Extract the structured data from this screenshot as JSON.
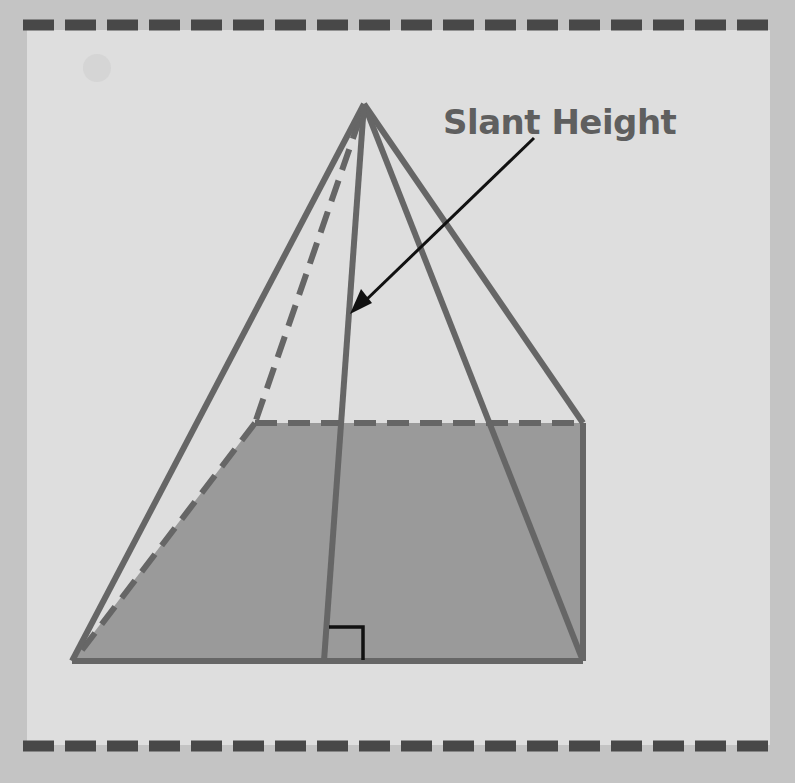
{
  "diagram": {
    "label": "Slant Height",
    "annotations": {
      "right_angle_marker": "right angle at base midpoint",
      "arrow": "points to slant height line"
    },
    "colors": {
      "background_outer": "#c4c4c4",
      "panel": "#dedede",
      "edge": "#666666",
      "base_fill": "#9a9a9a",
      "dash_border": "#484848",
      "arrow": "#111111",
      "label": "#5f5f5f"
    }
  }
}
